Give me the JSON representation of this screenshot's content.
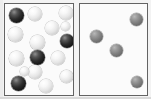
{
  "figure": {
    "background_color": "#f3f3f3",
    "width": 151,
    "height": 99,
    "panel_count": 2
  },
  "colors": {
    "panel_background": "#fbfbfb",
    "panel_border": "#636363",
    "light_sphere": "#f0f0f0",
    "dark_sphere": "#151515",
    "gray_sphere": "#7d7d7d",
    "page_background": "#f3f3f3"
  },
  "panels": [
    {
      "id": "left-panel",
      "label": "Left panel",
      "x": 4,
      "y": 3,
      "width": 70,
      "height": 93,
      "sphere_count": 16,
      "dark_count": 4,
      "light_count": 12,
      "spheres": [
        {
          "id": "L1",
          "kind": "dark",
          "cx": 15,
          "cy": 14,
          "d": 15
        },
        {
          "id": "L2",
          "kind": "light",
          "cx": 34,
          "cy": 13,
          "d": 14
        },
        {
          "id": "L3",
          "kind": "light",
          "cx": 65,
          "cy": 12,
          "d": 14
        },
        {
          "id": "L4",
          "kind": "light",
          "cx": 51,
          "cy": 27,
          "d": 14
        },
        {
          "id": "L5",
          "kind": "light",
          "cx": 14,
          "cy": 33,
          "d": 15
        },
        {
          "id": "L6",
          "kind": "light",
          "cx": 36,
          "cy": 41,
          "d": 15
        },
        {
          "id": "L7",
          "kind": "dark",
          "cx": 66,
          "cy": 40,
          "d": 14
        },
        {
          "id": "L8",
          "kind": "light",
          "cx": 15,
          "cy": 57,
          "d": 15
        },
        {
          "id": "L9",
          "kind": "dark",
          "cx": 36,
          "cy": 56,
          "d": 15
        },
        {
          "id": "L10",
          "kind": "light",
          "cx": 57,
          "cy": 57,
          "d": 14
        },
        {
          "id": "L11",
          "kind": "light",
          "cx": 34,
          "cy": 71,
          "d": 14
        },
        {
          "id": "L12",
          "kind": "light",
          "cx": 65,
          "cy": 75,
          "d": 13
        },
        {
          "id": "L13",
          "kind": "dark",
          "cx": 17,
          "cy": 82,
          "d": 15
        },
        {
          "id": "L14",
          "kind": "light",
          "cx": 45,
          "cy": 85,
          "d": 14
        },
        {
          "id": "L15",
          "kind": "light",
          "cx": 64,
          "cy": 25,
          "d": 9
        },
        {
          "id": "L16",
          "kind": "light",
          "cx": 23,
          "cy": 70,
          "d": 9
        }
      ]
    },
    {
      "id": "right-panel",
      "label": "Right panel",
      "x": 79,
      "y": 3,
      "width": 69,
      "height": 93,
      "sphere_count": 4,
      "gray_count": 4,
      "spheres": [
        {
          "id": "R1",
          "kind": "gray",
          "cx": 135,
          "cy": 18,
          "d": 13
        },
        {
          "id": "R2",
          "kind": "gray",
          "cx": 95,
          "cy": 35,
          "d": 13
        },
        {
          "id": "R3",
          "kind": "gray",
          "cx": 115,
          "cy": 49,
          "d": 13
        },
        {
          "id": "R4",
          "kind": "gray",
          "cx": 136,
          "cy": 81,
          "d": 12
        }
      ]
    }
  ]
}
